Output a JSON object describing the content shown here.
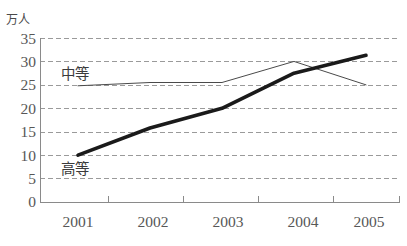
{
  "chart_data": {
    "type": "line",
    "title": "",
    "subtitle": "",
    "xlabel": "",
    "ylabel": "万人",
    "unit_label": "万人",
    "categories": [
      "2001",
      "2002",
      "2003",
      "2004",
      "2005"
    ],
    "x": [
      2001,
      2002,
      2003,
      2004,
      2005
    ],
    "xlim": [
      2001,
      2005
    ],
    "ylim": [
      0,
      35
    ],
    "yticks": [
      0,
      5,
      10,
      15,
      20,
      25,
      30,
      35
    ],
    "ytick_labels": [
      "0",
      "5",
      "10",
      "15",
      "20",
      "25",
      "30",
      "35"
    ],
    "xtick_labels": [
      "2001",
      "2002",
      "2003",
      "2004",
      "2005"
    ],
    "grid": true,
    "grid_style": "dashed-horizontal",
    "legend": "inline-annotation",
    "legend_position": "inside-left",
    "series": [
      {
        "name": "中等",
        "label": "中等",
        "style": "thin",
        "color": "#4a4a4a",
        "width": 1,
        "values": [
          24.8,
          25.5,
          25.5,
          30.0,
          25.0
        ]
      },
      {
        "name": "高等",
        "label": "高等",
        "style": "thick",
        "color": "#1a1a1a",
        "width": 3.6,
        "values": [
          10.0,
          15.8,
          20.0,
          27.5,
          31.3
        ]
      }
    ],
    "annotations": [
      {
        "text": "中等",
        "x": 2001.45,
        "y": 27.6
      },
      {
        "text": "高等",
        "x": 2001.45,
        "y": 7.5
      }
    ],
    "colors": {
      "axis": "#8a8a8a",
      "grid": "#9a9a9a",
      "text": "#575757",
      "series_thick": "#1a1a1a",
      "series_thin": "#4a4a4a",
      "background": "#ffffff"
    }
  }
}
